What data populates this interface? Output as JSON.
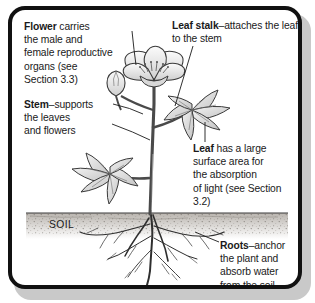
{
  "figure": {
    "soil_label": "SOIL",
    "frame_color": "#111111",
    "shadow_color": "#c9c9c9",
    "text_color": "#1a1a1a"
  },
  "callouts": {
    "flower": {
      "term": "Flower",
      "body": " carries\nthe male and\nfemale reproductive\norgans (see\nSection 3.3)"
    },
    "leaf_stalk": {
      "term": "Leaf stalk",
      "body": "–attaches the leaf\nto the stem"
    },
    "stem": {
      "term": "Stem",
      "body": "–supports\nthe leaves\nand flowers"
    },
    "leaf": {
      "term": "Leaf",
      "body": " has a large\nsurface area for\nthe absorption\nof light (see Section 3.2)"
    },
    "roots": {
      "term": "Roots",
      "body": "–anchor\nthe plant and\nabsorb water\nfrom the soil"
    }
  }
}
